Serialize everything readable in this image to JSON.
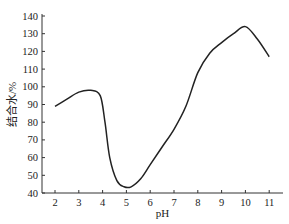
{
  "chart_data": {
    "type": "line",
    "title": "",
    "xlabel": "pH",
    "ylabel": "结合水/%",
    "xlim": [
      1.5,
      11.7
    ],
    "ylim": [
      40,
      140
    ],
    "xticks": [
      2,
      3,
      4,
      5,
      6,
      7,
      8,
      9,
      10,
      11
    ],
    "yticks": [
      40,
      50,
      60,
      70,
      80,
      90,
      100,
      110,
      120,
      130,
      140
    ],
    "grid": false,
    "legend": null,
    "series": [
      {
        "name": "结合水",
        "x": [
          2,
          2.5,
          3,
          3.5,
          3.9,
          4.1,
          4.3,
          4.6,
          4.9,
          5.2,
          5.6,
          6,
          6.5,
          7,
          7.5,
          8,
          8.5,
          9,
          9.5,
          10,
          10.5,
          11
        ],
        "y": [
          89,
          93,
          97,
          98,
          95,
          80,
          60,
          47,
          43.5,
          43.5,
          48,
          56,
          66,
          76,
          89,
          108,
          119,
          125,
          130,
          134,
          127,
          117
        ]
      }
    ]
  }
}
